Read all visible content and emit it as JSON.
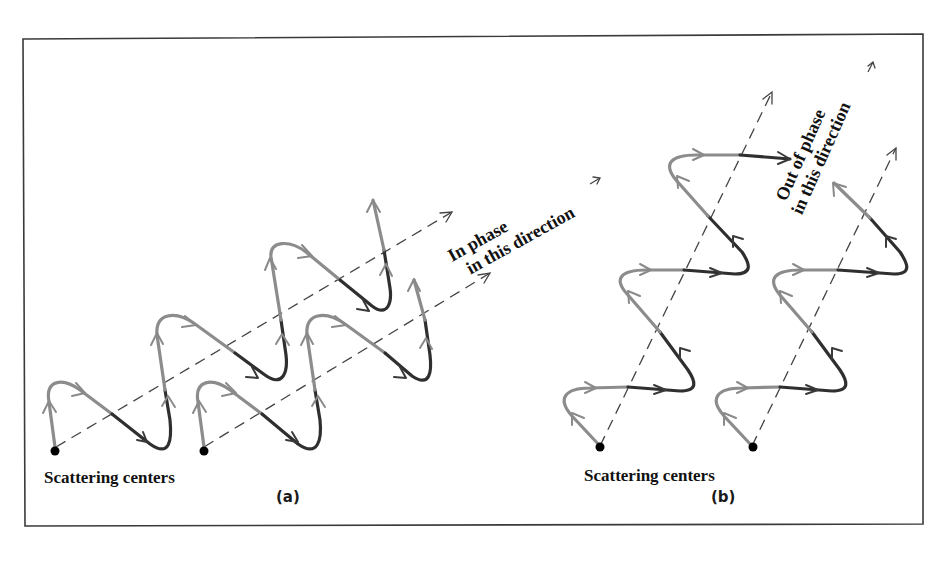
{
  "figure": {
    "panels": [
      {
        "id": "a",
        "label": "(a)",
        "centers_label": "Scattering centers",
        "annotation_line1": "In phase",
        "annotation_line2": "in this direction",
        "description": "Two waves from scattering centers traveling at a shallow angle; crests align along dashed direction lines"
      },
      {
        "id": "b",
        "label": "(b)",
        "centers_label": "Scattering centers",
        "annotation_line1": "Out of phase",
        "annotation_line2": "in this direction",
        "description": "Two waves from scattering centers traveling at a steep angle; crests misaligned along dashed direction lines"
      }
    ],
    "colors": {
      "frame": "#3a3a3a",
      "wave_light": "#8c8c8c",
      "wave_dark": "#2f2f2f",
      "dashed_line": "#444444",
      "scattering_center": "#000000",
      "text": "#111111"
    }
  }
}
